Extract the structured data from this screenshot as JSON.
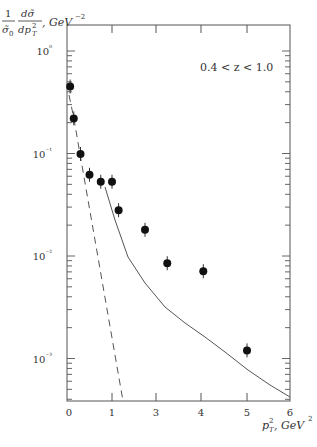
{
  "chart_data": {
    "type": "scatter",
    "title": "",
    "annotation": "0.4 < z < 1.0",
    "ylabel": "1/σ̃₀ dσ̃/dp_T², GeV⁻²",
    "ylabel_parts": {
      "numerator_left": "1",
      "denominator_left": "σ̃₀",
      "numerator_right": "dσ̃",
      "denominator_right": "dp²T",
      "units": "GeV⁻²"
    },
    "xlabel": "p²T, GeV²",
    "yscale": "log",
    "ylim": [
      0.00037,
      1.8
    ],
    "xlim": [
      0,
      6
    ],
    "x_ticks": [
      {
        "label": "0",
        "px": 67
      },
      {
        "label": "1",
        "px": 112
      },
      {
        "label": "3",
        "px": 156
      },
      {
        "label": "4",
        "px": 201
      },
      {
        "label": "5",
        "px": 247
      },
      {
        "label": "6",
        "px": 290
      }
    ],
    "y_ticks": [
      {
        "label": "10⁰",
        "value": 1
      },
      {
        "label": "10⁻¹",
        "value": 0.1
      },
      {
        "label": "10⁻²",
        "value": 0.01
      },
      {
        "label": "10⁻³",
        "value": 0.001
      }
    ],
    "grid": false,
    "series": [
      {
        "name": "data",
        "style": "points-with-errorbars",
        "x": [
          0.07,
          0.15,
          0.3,
          0.5,
          0.75,
          1.0,
          1.3,
          2.5,
          3.25,
          4.05,
          5.0
        ],
        "y": [
          0.45,
          0.22,
          0.099,
          0.062,
          0.053,
          0.053,
          0.028,
          0.018,
          0.0085,
          0.0071,
          0.0012
        ]
      },
      {
        "name": "solid-curve",
        "style": "solid",
        "x": [
          0.8,
          1.05,
          1.35,
          2.75,
          3.2,
          3.65,
          4.1,
          5.0,
          6.0
        ],
        "y": [
          0.048,
          0.022,
          0.0095,
          0.0055,
          0.0032,
          0.0022,
          0.0015,
          0.00068,
          0.00038
        ]
      },
      {
        "name": "dashed-curve",
        "style": "dashed",
        "x": [
          0.02,
          1.25
        ],
        "y": [
          0.38,
          0.00037
        ]
      }
    ]
  },
  "labels": {
    "annotation": "0.4 < z < 1.0",
    "y_one": "1",
    "y_sigma0": "σ̃",
    "y_sigma0_sub": "0",
    "y_dsigma": "dσ̃",
    "y_dpt": "dp",
    "y_units": ", GeV",
    "y_units_exp": "−2",
    "x_var": "p",
    "x_units": ", GeV",
    "x_units_exp": "2"
  }
}
